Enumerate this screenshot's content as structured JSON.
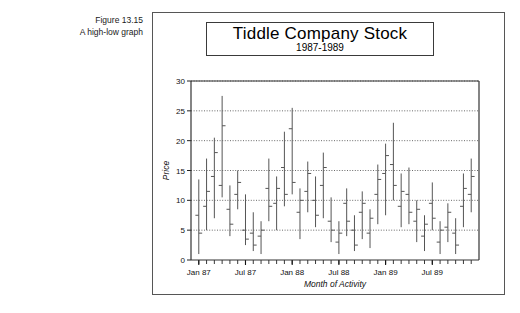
{
  "caption": {
    "line1": "Figure 13.15",
    "line2": "A high-low graph"
  },
  "chart_data": {
    "type": "bar",
    "subtype": "high-low-close",
    "title": "Tiddle Company Stock",
    "subtitle": "1987-1989",
    "xlabel": "Month of Activity",
    "ylabel": "Price",
    "ylim": [
      0,
      30
    ],
    "yticks": [
      0,
      5,
      10,
      15,
      20,
      25,
      30
    ],
    "ytick_labels": [
      "0",
      "5",
      "10",
      "15",
      "20",
      "25",
      "30"
    ],
    "grid": "horizontal-dotted",
    "legend": "none",
    "xtick_labels": [
      "Jan 87",
      "Jul 87",
      "Jan 88",
      "Jul 88",
      "Jan 89",
      "Jul 89"
    ],
    "xtick_label_positions": [
      0,
      6,
      12,
      18,
      24,
      30
    ],
    "x_minor_ticks": 36,
    "categories": [
      "Jan 87",
      "Feb 87",
      "Mar 87",
      "Apr 87",
      "May 87",
      "Jun 87",
      "Jul 87",
      "Aug 87",
      "Sep 87",
      "Oct 87",
      "Nov 87",
      "Dec 87",
      "Jan 88",
      "Feb 88",
      "Mar 88",
      "Apr 88",
      "May 88",
      "Jun 88",
      "Jul 88",
      "Aug 88",
      "Sep 88",
      "Oct 88",
      "Nov 88",
      "Dec 88",
      "Jan 89",
      "Feb 89",
      "Mar 89",
      "Apr 89",
      "May 89",
      "Jun 89",
      "Jul 89",
      "Aug 89",
      "Sep 89",
      "Oct 89",
      "Nov 89",
      "Dec 89"
    ],
    "series": [
      {
        "name": "High",
        "values": [
          13.5,
          17.0,
          20.5,
          27.5,
          12.5,
          15.0,
          11.0,
          8.0,
          6.5,
          17.0,
          14.0,
          21.5,
          25.5,
          12.0,
          16.5,
          14.0,
          18.0,
          10.5,
          6.5,
          12.0,
          7.5,
          11.5,
          8.5,
          16.0,
          19.5,
          23.0,
          14.5,
          15.5,
          10.0,
          7.5,
          13.0,
          6.5,
          9.5,
          7.0,
          14.5,
          17.0
        ]
      },
      {
        "name": "Low",
        "values": [
          1.0,
          5.0,
          7.0,
          10.5,
          4.0,
          8.5,
          2.5,
          1.5,
          1.0,
          6.5,
          5.0,
          9.0,
          11.0,
          3.5,
          8.0,
          5.5,
          7.0,
          3.0,
          1.0,
          4.0,
          1.5,
          3.5,
          2.0,
          6.0,
          7.5,
          10.0,
          5.5,
          6.0,
          3.0,
          1.5,
          5.0,
          1.0,
          3.0,
          1.0,
          5.5,
          8.0
        ]
      },
      {
        "name": "Open",
        "values": [
          7.5,
          9.0,
          14.0,
          12.5,
          8.5,
          11.0,
          5.0,
          4.5,
          4.0,
          12.0,
          9.5,
          15.5,
          22.0,
          8.0,
          11.5,
          10.0,
          12.5,
          6.5,
          3.0,
          9.5,
          5.0,
          8.0,
          4.5,
          11.0,
          14.5,
          16.0,
          9.0,
          11.0,
          6.5,
          4.0,
          9.5,
          3.0,
          5.5,
          4.5,
          9.0,
          11.0
        ]
      },
      {
        "name": "Close",
        "values": [
          4.5,
          11.5,
          18.0,
          22.5,
          6.0,
          13.0,
          3.5,
          2.5,
          5.0,
          9.0,
          12.0,
          11.0,
          13.0,
          10.0,
          14.5,
          7.5,
          15.5,
          5.0,
          4.5,
          6.5,
          2.5,
          9.5,
          7.0,
          13.5,
          17.5,
          12.5,
          11.5,
          8.0,
          8.5,
          6.0,
          7.0,
          5.0,
          8.0,
          2.5,
          12.0,
          14.0
        ]
      }
    ]
  }
}
